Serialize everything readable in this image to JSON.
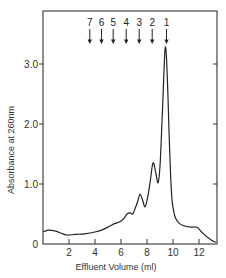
{
  "chart_data": {
    "type": "line",
    "title": "",
    "xlabel": "Effluent Volume (ml)",
    "ylabel": "Absorbance at 260nm",
    "xlim": [
      0,
      13.4
    ],
    "ylim": [
      0,
      3.8
    ],
    "grid": false,
    "legend": null,
    "x_ticks": [
      2,
      4,
      6,
      8,
      10,
      12
    ],
    "x_tick_labels": [
      "2",
      "4",
      "6",
      "8",
      "10",
      "12"
    ],
    "y_ticks": [
      0,
      1.0,
      2.0,
      3.0
    ],
    "y_tick_labels": [
      "0",
      "1.0",
      "2.0",
      "3.0"
    ],
    "series": [
      {
        "name": "A260",
        "x": [
          0.0,
          0.4,
          0.9,
          1.4,
          1.85,
          2.5,
          3.2,
          4.0,
          4.6,
          5.15,
          5.5,
          5.9,
          6.2,
          6.46,
          6.7,
          6.9,
          7.1,
          7.3,
          7.46,
          7.65,
          7.85,
          8.05,
          8.25,
          8.46,
          8.65,
          8.85,
          9.0,
          9.15,
          9.3,
          9.4,
          9.5,
          9.62,
          9.75,
          9.9,
          10.05,
          10.2,
          10.5,
          10.9,
          11.4,
          11.85,
          12.2,
          12.6,
          13.0,
          13.3
        ],
        "y": [
          0.2,
          0.23,
          0.22,
          0.18,
          0.15,
          0.16,
          0.17,
          0.2,
          0.24,
          0.3,
          0.34,
          0.37,
          0.42,
          0.5,
          0.52,
          0.5,
          0.6,
          0.72,
          0.83,
          0.74,
          0.62,
          0.78,
          1.05,
          1.35,
          1.22,
          1.02,
          1.3,
          2.0,
          2.85,
          3.27,
          3.1,
          2.4,
          1.5,
          0.8,
          0.55,
          0.43,
          0.34,
          0.3,
          0.28,
          0.28,
          0.2,
          0.12,
          0.06,
          0.03
        ]
      }
    ],
    "annotations": [
      {
        "label": "7",
        "x": 3.6,
        "type": "down-arrow"
      },
      {
        "label": "6",
        "x": 4.5,
        "type": "down-arrow"
      },
      {
        "label": "5",
        "x": 5.4,
        "type": "down-arrow"
      },
      {
        "label": "4",
        "x": 6.4,
        "type": "down-arrow"
      },
      {
        "label": "3",
        "x": 7.4,
        "type": "down-arrow"
      },
      {
        "label": "2",
        "x": 8.4,
        "type": "down-arrow"
      },
      {
        "label": "1",
        "x": 9.5,
        "type": "down-arrow"
      }
    ]
  }
}
